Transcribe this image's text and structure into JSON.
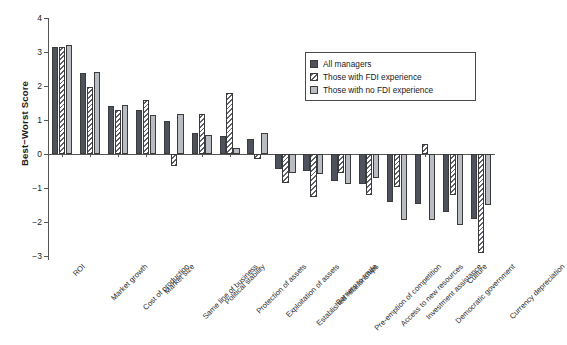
{
  "axis": {
    "ylabel": "Best−Worst Score",
    "yticks": [
      4,
      3,
      2,
      1,
      0,
      -1,
      -2,
      -3
    ],
    "ytick_labels": [
      "4",
      "3",
      "2",
      "1",
      "0",
      "−1",
      "−2",
      "−3"
    ],
    "ylim": [
      -3,
      4
    ],
    "xlabel": ""
  },
  "legend": {
    "position": "top-right",
    "entries": [
      {
        "label": "All managers",
        "style": "solid-dark",
        "color": "#4d525c"
      },
      {
        "label": "Those with FDI experience",
        "style": "diagonal-hatch",
        "color": "#ffffff"
      },
      {
        "label": "Those with no FDI experience",
        "style": "solid-light",
        "color": "#b9bcc2"
      }
    ]
  },
  "chart_data": {
    "type": "bar",
    "title": "",
    "xlabel": "",
    "ylabel": "Best−Worst Score",
    "ylim": [
      -3,
      4
    ],
    "grid": false,
    "legend_position": "upper right",
    "categories": [
      "ROI",
      "Market growth",
      "Cost of production",
      "Market size",
      "Same line of business",
      "Political stability",
      "Protection of assets",
      "Exploitation of assets",
      "Established relationships",
      "Barriers to trade",
      "Pre-emption of competition",
      "Access to new resources",
      "Investment assistance",
      "Democratic government",
      "Culture",
      "Currency depreciation"
    ],
    "series": [
      {
        "name": "All managers",
        "values": [
          3.16,
          2.38,
          1.41,
          1.28,
          0.96,
          0.63,
          0.52,
          0.45,
          -0.45,
          -0.5,
          -0.78,
          -0.88,
          -1.42,
          -1.48,
          -1.7,
          -1.9
        ]
      },
      {
        "name": "Those with FDI experience",
        "values": [
          3.16,
          1.98,
          1.28,
          1.58,
          -0.35,
          1.18,
          1.8,
          -0.15,
          -0.85,
          -1.25,
          -0.55,
          -1.2,
          -0.98,
          0.3,
          -1.22,
          -2.92
        ]
      },
      {
        "name": "Those with no FDI experience",
        "values": [
          3.2,
          2.42,
          1.45,
          1.14,
          1.17,
          0.55,
          0.17,
          0.62,
          -0.55,
          -0.6,
          -0.88,
          -0.72,
          -1.95,
          -1.95,
          -2.1,
          -1.5
        ]
      }
    ]
  }
}
